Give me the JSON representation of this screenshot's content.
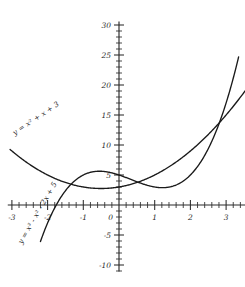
{
  "chart_data": {
    "type": "line",
    "title": "",
    "xlabel": "",
    "ylabel": "",
    "xlim": [
      -3.1,
      4.05
    ],
    "ylim": [
      -11.0,
      30.5
    ],
    "grid": false,
    "legend_position": "inline-curve-labels",
    "x_ticks": [
      -3,
      -2,
      -1,
      0,
      1,
      2,
      3,
      4
    ],
    "x_tick_labels": [
      "-3",
      "-2",
      "-1",
      "0",
      "1",
      "2",
      "3",
      "4"
    ],
    "x_minor_step": 0.2,
    "y_ticks": [
      -10,
      -5,
      0,
      5,
      10,
      15,
      20,
      25,
      30
    ],
    "y_tick_labels": [
      "-10",
      "-5",
      "",
      "5",
      "10",
      "15",
      "20",
      "25",
      "30"
    ],
    "y_minor_step": 1,
    "origin_label": "0",
    "series": [
      {
        "name": "parabola",
        "label": "y = x² + x + 3",
        "expression": "x^2 + x + 3",
        "color": "#1a1a1a",
        "label_rotation": -34,
        "label_x": -2.92,
        "label_y": 11.6,
        "x_start": -3.05,
        "x_end": 4.02,
        "key_points": [
          {
            "x": -3,
            "y": 9
          },
          {
            "x": -2,
            "y": 5
          },
          {
            "x": -1,
            "y": 3
          },
          {
            "x": -0.5,
            "y": 2.75
          },
          {
            "x": 0,
            "y": 3
          },
          {
            "x": 1,
            "y": 5
          },
          {
            "x": 2,
            "y": 9
          },
          {
            "x": 3,
            "y": 15
          },
          {
            "x": 4,
            "y": 23
          }
        ]
      },
      {
        "name": "cubic",
        "label": "y = x³ - x² - 2x + 5",
        "expression": "x^3 - x^2 - 2x + 5",
        "color": "#1a1a1a",
        "label_rotation": -60,
        "label_x": -2.72,
        "label_y": -6.6,
        "x_start": -2.2,
        "x_end": 3.35,
        "key_points": [
          {
            "x": -2,
            "y": -3
          },
          {
            "x": -1.79,
            "y": 0
          },
          {
            "x": -1,
            "y": 5
          },
          {
            "x": -0.55,
            "y": 5.76
          },
          {
            "x": 0,
            "y": 5
          },
          {
            "x": 1,
            "y": 3
          },
          {
            "x": 1.22,
            "y": 2.87
          },
          {
            "x": 2,
            "y": 5
          },
          {
            "x": 3,
            "y": 17
          },
          {
            "x": 3.35,
            "y": 24.7
          }
        ]
      }
    ],
    "intersections": [
      {
        "x": -1.0,
        "y": 3.0
      },
      {
        "x": 0.45,
        "y": 3.65
      },
      {
        "x": 2.95,
        "y": 14.6
      }
    ]
  }
}
